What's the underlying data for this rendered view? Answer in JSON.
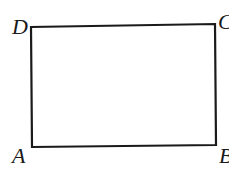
{
  "diagram": {
    "type": "rectangle",
    "name": "ABCD",
    "stroke_color": "#1a1a1a",
    "vertices": [
      {
        "label": "A",
        "x": 32,
        "y": 147,
        "label_x": 12,
        "label_y": 163
      },
      {
        "label": "B",
        "x": 216,
        "y": 145,
        "label_x": 219,
        "label_y": 163
      },
      {
        "label": "C",
        "x": 215,
        "y": 24,
        "label_x": 218,
        "label_y": 29
      },
      {
        "label": "D",
        "x": 31,
        "y": 27,
        "label_x": 12,
        "label_y": 34
      }
    ]
  }
}
